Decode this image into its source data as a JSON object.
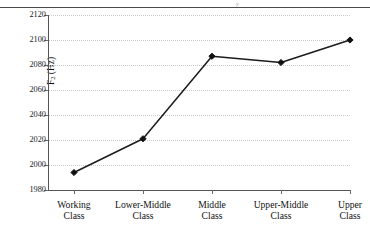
{
  "figure": {
    "axis_title_y": "F",
    "axis_title_y_sub": "2",
    "axis_title_y_unit": " (Hz)",
    "top_rule_fragment": "y"
  },
  "chart_data": {
    "type": "line",
    "title": "",
    "xlabel": "",
    "ylabel": "F2 (Hz)",
    "categories": [
      "Working\nClass",
      "Lower-Middle\nClass",
      "Middle\nClass",
      "Upper-Middle\nClass",
      "Upper\nClass"
    ],
    "values": [
      1994,
      2021,
      2087,
      2082,
      2100
    ],
    "ylim": [
      1980,
      2120
    ],
    "yticks": [
      1980,
      2000,
      2020,
      2040,
      2060,
      2080,
      2100,
      2120
    ],
    "ytick_labels": [
      "1980",
      "2000",
      "2020",
      "2040",
      "2060",
      "2080",
      "2100",
      "2120"
    ],
    "grid": true,
    "grid_axis": "y",
    "legend": false,
    "marker": "diamond",
    "line_color": "#1b1b1b",
    "marker_color": "#111111",
    "grid_color": "#c9c9c9"
  }
}
